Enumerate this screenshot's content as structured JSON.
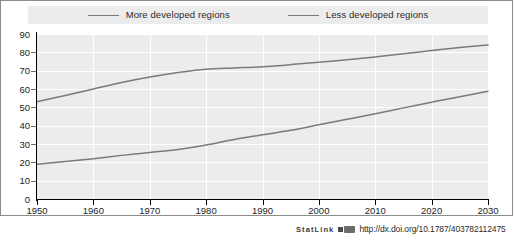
{
  "legend": {
    "entries": [
      {
        "label": "More developed regions",
        "color": "#7a7a7a",
        "icon": "line-swatch-icon"
      },
      {
        "label": "Less developed regions",
        "color": "#7a7a7a",
        "icon": "line-swatch-icon"
      }
    ]
  },
  "statlink": {
    "word": "StatLink",
    "url": "http://dx.doi.org/10.1787/403782112475",
    "icon": "statlink-glyph-icon"
  },
  "chart_data": {
    "type": "line",
    "title": "",
    "subtitle": "",
    "xlabel": "",
    "ylabel": "",
    "xlim": [
      1950,
      2030
    ],
    "ylim": [
      0,
      90
    ],
    "grid": true,
    "legend_position": "top-center",
    "xticks": [
      1950,
      1960,
      1970,
      1980,
      1990,
      2000,
      2010,
      2020,
      2030
    ],
    "yticks": [
      0,
      10,
      20,
      30,
      40,
      50,
      60,
      70,
      80,
      90
    ],
    "x": [
      1950,
      1955,
      1960,
      1965,
      1970,
      1975,
      1980,
      1985,
      1990,
      1995,
      2000,
      2005,
      2010,
      2015,
      2020,
      2025,
      2030
    ],
    "series": [
      {
        "name": "More developed regions",
        "color": "#7a7a7a",
        "values": [
          53.0,
          56.5,
          60.0,
          63.5,
          66.5,
          69.0,
          70.8,
          71.5,
          72.2,
          73.3,
          74.6,
          76.0,
          77.5,
          79.2,
          81.0,
          82.6,
          84.0
        ]
      },
      {
        "name": "Less developed regions",
        "color": "#7a7a7a",
        "values": [
          19.0,
          20.5,
          22.0,
          23.8,
          25.4,
          27.0,
          29.5,
          32.5,
          35.0,
          37.5,
          40.5,
          43.5,
          46.5,
          49.7,
          52.8,
          55.8,
          58.8
        ]
      }
    ]
  }
}
